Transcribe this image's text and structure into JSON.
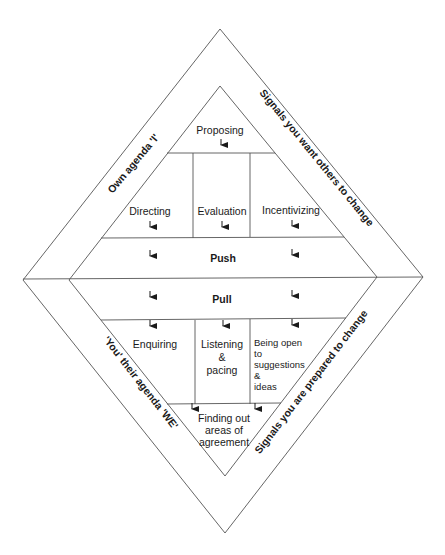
{
  "diagram": {
    "side_labels": {
      "top_left": "Own agenda 'I'",
      "top_right": "Signals you want others to change",
      "bottom_left": "'You' their agenda 'WE'",
      "bottom_right": "Signals you are prepared to change"
    },
    "push_section": {
      "apex": "Proposing",
      "cells": [
        "Directing",
        "Evaluation",
        "Incentivizing"
      ],
      "band": "Push"
    },
    "pull_section": {
      "band": "Pull",
      "cells": {
        "left": "Enquiring",
        "middle": [
          "Listening",
          "&",
          "pacing"
        ],
        "right": [
          "Being open",
          "to",
          "suggestions",
          "&",
          "ideas"
        ]
      },
      "apex": [
        "Finding out",
        "areas of",
        "agreement"
      ]
    },
    "colors": {
      "line": "#555555",
      "text": "#1a1a1a",
      "background": "#ffffff"
    }
  }
}
